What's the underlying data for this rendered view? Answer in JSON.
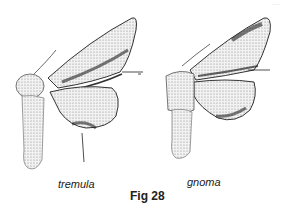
{
  "figure": {
    "caption": "Fig 28",
    "specimens": [
      {
        "name": "tremula",
        "position": "left"
      },
      {
        "name": "gnoma",
        "position": "right"
      }
    ],
    "corner_text": "....."
  }
}
